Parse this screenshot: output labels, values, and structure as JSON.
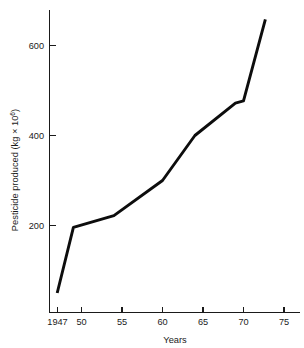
{
  "chart_data": {
    "type": "line",
    "title": "",
    "xlabel": "Years",
    "ylabel_main": "Pesticide produced (kg × 10",
    "ylabel_exponent": "6",
    "ylabel_close": ")",
    "ylabel_full": "Pesticide produced (kg × 10⁶)",
    "x": [
      1947,
      1949,
      1954,
      1960,
      1964,
      1969,
      1970,
      1972.7
    ],
    "values": [
      50,
      196,
      222,
      300,
      400,
      472,
      477,
      658
    ],
    "series": [
      {
        "name": "Pesticide produced",
        "points": [
          {
            "x": 1947,
            "y": 50
          },
          {
            "x": 1949,
            "y": 196
          },
          {
            "x": 1954,
            "y": 222
          },
          {
            "x": 1960,
            "y": 300
          },
          {
            "x": 1964,
            "y": 400
          },
          {
            "x": 1969,
            "y": 472
          },
          {
            "x": 1970,
            "y": 477
          },
          {
            "x": 1972.7,
            "y": 658
          }
        ]
      }
    ],
    "xticks": [
      {
        "value": 1947,
        "label": "1947"
      },
      {
        "value": 1950,
        "label": "50"
      },
      {
        "value": 1955,
        "label": "55"
      },
      {
        "value": 1960,
        "label": "60"
      },
      {
        "value": 1965,
        "label": "65"
      },
      {
        "value": 1970,
        "label": "70"
      },
      {
        "value": 1975,
        "label": "75"
      }
    ],
    "yticks": [
      {
        "value": 200,
        "label": "200"
      },
      {
        "value": 400,
        "label": "400"
      },
      {
        "value": 600,
        "label": "600"
      }
    ],
    "xlim": [
      1945.8,
      1976.8
    ],
    "ylim": [
      0,
      700
    ],
    "grid": false,
    "legend": null,
    "line_color": "#0d0d0d",
    "axis_color": "#1a1a1a",
    "background_color": "#ffffff"
  }
}
